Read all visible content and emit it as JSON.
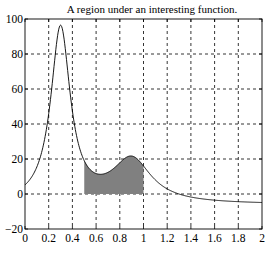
{
  "chart_data": {
    "type": "area",
    "title": "A region under an interesting function.",
    "xlabel": "",
    "ylabel": "",
    "xlim": [
      0,
      2
    ],
    "ylim": [
      -20,
      100
    ],
    "grid": true,
    "legend": null,
    "x_ticks": [
      0,
      0.2,
      0.4,
      0.6,
      0.8,
      1,
      1.2,
      1.4,
      1.6,
      1.8,
      2
    ],
    "x_tick_labels": [
      "0",
      "0.2",
      "0.4",
      "0.6",
      "0.8",
      "1",
      "1.2",
      "1.4",
      "1.6",
      "1.8",
      "2"
    ],
    "y_ticks": [
      -20,
      0,
      20,
      40,
      60,
      80,
      100
    ],
    "y_tick_labels": [
      "−20",
      "0",
      "20",
      "40",
      "60",
      "80",
      "100"
    ],
    "function": "1/((x-0.3)^2+0.01) + 1/((x-0.9)^2+0.04) - 6",
    "series": [
      {
        "name": "curve",
        "x": [
          0,
          0.1,
          0.2,
          0.25,
          0.3,
          0.35,
          0.4,
          0.5,
          0.6,
          0.7,
          0.8,
          0.9,
          1.0,
          1.2,
          1.4,
          1.6,
          1.8,
          2.0
        ],
        "values": [
          5.18,
          15.69,
          45.09,
          76.29,
          96.5,
          76.25,
          44.06,
          18.4,
          11.79,
          13.14,
          19.3,
          21.69,
          16.0,
          3.58,
          -0.76,
          -2.71,
          -3.84,
          -4.56
        ]
      }
    ],
    "shaded_region": {
      "x_start": 0.5,
      "x_end": 1.0,
      "baseline": 0,
      "fill_color": "#808080"
    },
    "colors": {
      "line": "#000000",
      "fill": "#808080",
      "grid": "#000000"
    }
  }
}
